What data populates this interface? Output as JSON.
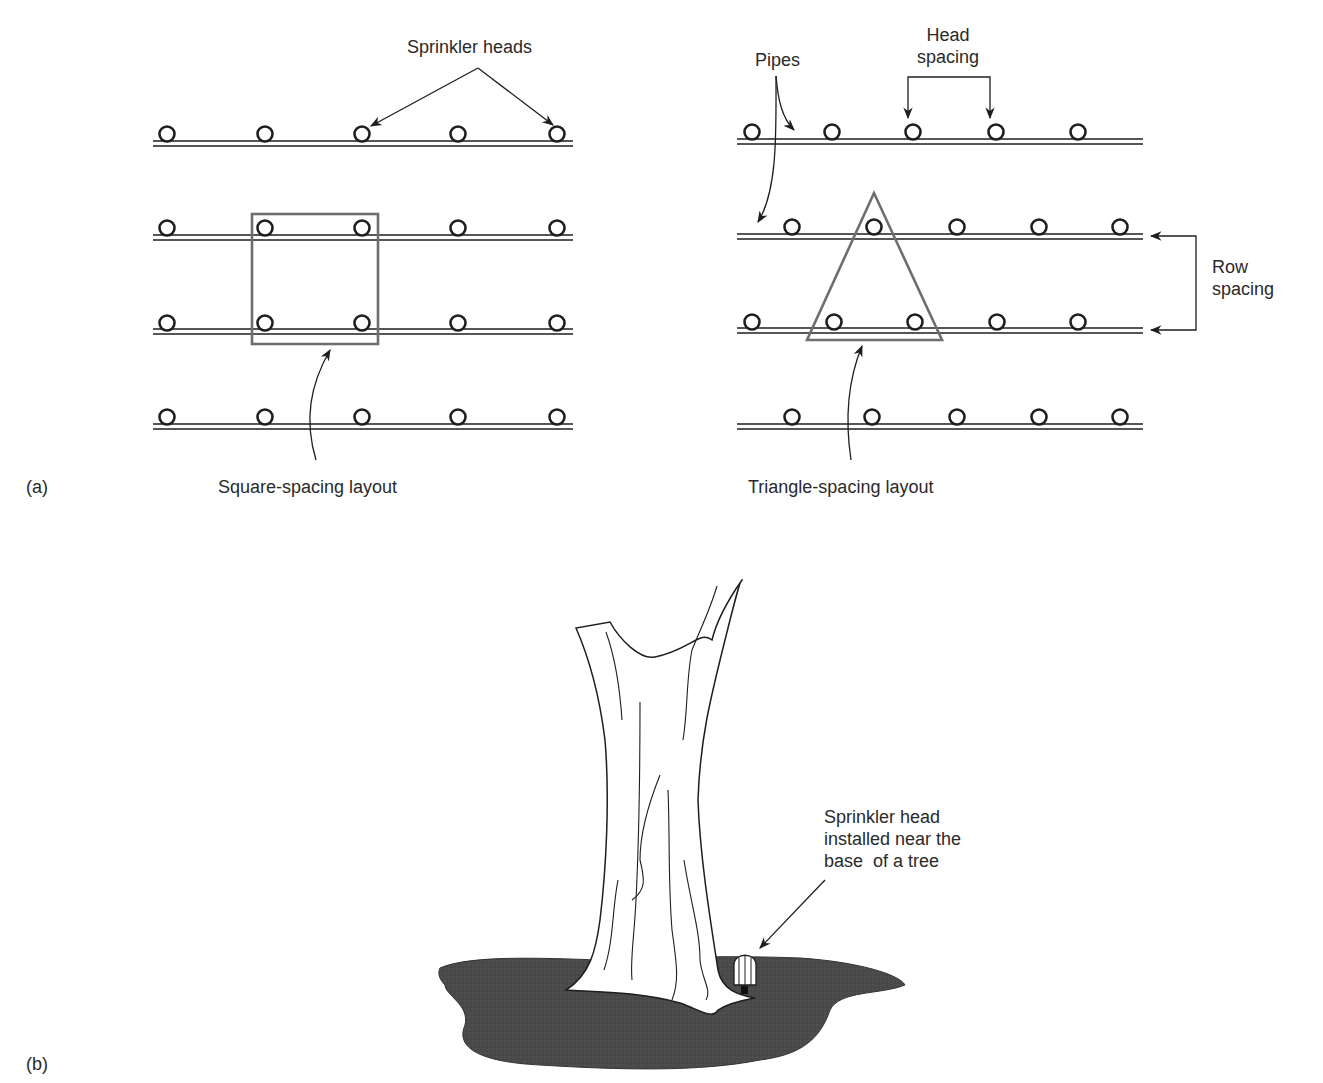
{
  "figure": {
    "panel_a": {
      "label": "(a)",
      "square_layout": {
        "caption": "Square-spacing layout",
        "callout": "Sprinkler heads",
        "rows": 4,
        "heads_per_row": 5
      },
      "triangle_layout": {
        "caption": "Triangle-spacing layout",
        "callout_pipes": "Pipes",
        "callout_head_spacing": [
          "Head",
          "spacing"
        ],
        "callout_row_spacing": [
          "Row",
          "spacing"
        ],
        "rows": 4,
        "heads_per_row": 5
      }
    },
    "panel_b": {
      "label": "(b)",
      "callout": [
        "Sprinkler head",
        "installed near the",
        "base  of a tree"
      ]
    },
    "colors": {
      "ink": "#1e1e1e",
      "outline_gray": "#6e6e6e",
      "ground": "#4a4a4a",
      "background": "#ffffff"
    }
  }
}
